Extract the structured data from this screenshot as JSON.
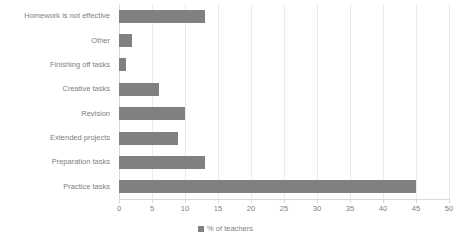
{
  "chart_data": {
    "type": "bar",
    "orientation": "horizontal",
    "title": "",
    "xlabel": "",
    "ylabel": "",
    "categories": [
      "Homework is not effective",
      "Other",
      "Finishing off tasks",
      "Creative tasks",
      "Revision",
      "Extended projects",
      "Preparation tasks",
      "Practice tasks"
    ],
    "values": [
      13,
      2,
      1,
      6,
      10,
      9,
      13,
      45
    ],
    "series": [
      {
        "name": "% of teachers",
        "values": [
          13,
          2,
          1,
          6,
          10,
          9,
          13,
          45
        ]
      }
    ],
    "xlim": [
      0,
      50
    ],
    "xticks": [
      0,
      5,
      10,
      15,
      20,
      25,
      30,
      35,
      40,
      45,
      50
    ],
    "xtick_labels": [
      "0",
      "5",
      "10",
      "15",
      "20",
      "25",
      "30",
      "35",
      "40",
      "45",
      "50"
    ],
    "grid": true,
    "grid_axis": "x",
    "legend": {
      "position": "bottom",
      "entries": [
        "% of teachers"
      ]
    },
    "colors": {
      "bar": "#808080",
      "gridline": "#ebebeb",
      "axis": "#d9d9d9",
      "text": "#808080",
      "background": "#ffffff"
    }
  }
}
